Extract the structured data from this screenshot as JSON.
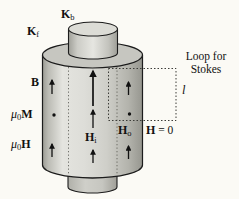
{
  "labels": {
    "kb": {
      "main": "K",
      "sub": "b"
    },
    "kf": {
      "main": "K",
      "sub": "f"
    },
    "b_field": {
      "main": "B"
    },
    "mu0m": {
      "mu": "μ",
      "sub": "0",
      "vec": "M"
    },
    "mu0h": {
      "mu": "μ",
      "sub": "0",
      "vec": "H"
    },
    "hi": {
      "main": "H",
      "sub": "i"
    },
    "ho": {
      "main": "H",
      "sub": "o"
    },
    "h_zero": {
      "main": "H",
      "rest": " = 0"
    },
    "loop_caption": {
      "line1": "Loop for",
      "line2": "Stokes"
    },
    "length_symbol": "l"
  },
  "glyphs": {
    "field_direction": "up-arrow",
    "out_of_surface": "dot"
  },
  "colors": {
    "background": "#fbfaf5",
    "outline": "#1c1c1c",
    "cylinder_top": "#c6c6c0",
    "inner_cylinder_top": "#dcdcd6",
    "body_highlight": "#e4e4df",
    "body_shadow": "#96968f",
    "loop_stroke": "#3c3c38",
    "arrow": "#111111"
  }
}
